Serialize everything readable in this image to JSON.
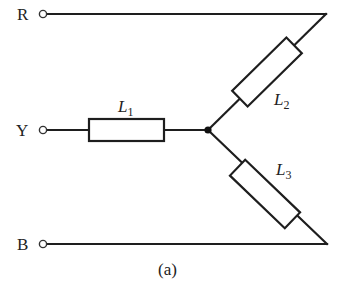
{
  "diagram": {
    "type": "star-connected three-phase load",
    "caption": "(a)",
    "terminals": [
      {
        "id": "R",
        "label": "R"
      },
      {
        "id": "Y",
        "label": "Y"
      },
      {
        "id": "B",
        "label": "B"
      }
    ],
    "components": [
      {
        "id": "L1",
        "symbol": "L",
        "subscript": "1",
        "connects": [
          "Y",
          "neutral"
        ]
      },
      {
        "id": "L2",
        "symbol": "L",
        "subscript": "2",
        "connects": [
          "R",
          "neutral"
        ]
      },
      {
        "id": "L3",
        "symbol": "L",
        "subscript": "3",
        "connects": [
          "B",
          "neutral"
        ]
      }
    ],
    "neutral_point": "star junction"
  }
}
